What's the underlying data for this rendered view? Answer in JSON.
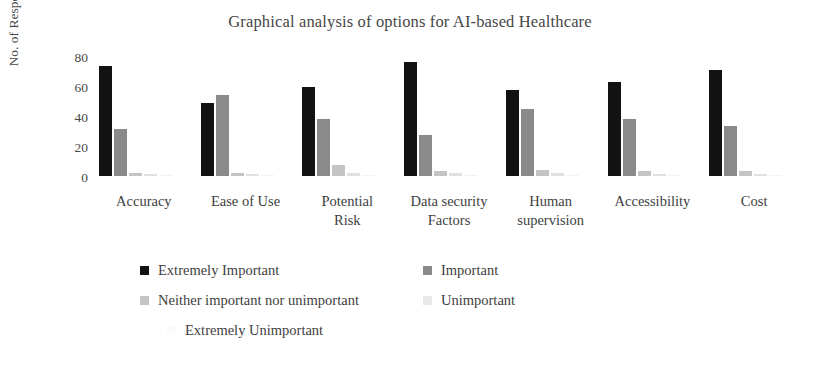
{
  "chart_data": {
    "type": "bar",
    "title": "Graphical analysis of options for AI-based Healthcare",
    "xlabel": "",
    "ylabel": "No. of Respondents",
    "ylim": [
      0,
      80
    ],
    "yticks": [
      0,
      20,
      40,
      60,
      80
    ],
    "grid": false,
    "legend_position": "bottom",
    "grouping": "clustered",
    "categories": [
      "Accuracy",
      "Ease of Use",
      "Potential Risk",
      "Data security Factors",
      "Human supervision",
      "Accessibility",
      "Cost"
    ],
    "series": [
      {
        "name": "Extremely Important",
        "color": "#121212",
        "values": [
          68,
          45,
          55,
          70,
          53,
          58,
          65
        ]
      },
      {
        "name": "Important",
        "color": "#8a8a8a",
        "values": [
          29,
          50,
          35,
          25,
          41,
          35,
          31
        ]
      },
      {
        "name": "Neither important nor unimportant",
        "color": "#c4c4c4",
        "values": [
          2,
          2,
          7,
          3,
          4,
          3,
          3
        ]
      },
      {
        "name": "Unimportant",
        "color": "#e0e0e0",
        "values": [
          1,
          1,
          2,
          2,
          2,
          1,
          1
        ]
      },
      {
        "name": "Extremely Unimportant",
        "color": "#f2f2f2",
        "values": [
          0,
          0,
          0,
          0,
          0,
          0,
          0
        ]
      }
    ]
  },
  "axis": {
    "y_tick_labels": [
      "80",
      "60",
      "40",
      "20",
      "0"
    ],
    "y_title": "No. of Respondents"
  },
  "category_labels": [
    [
      "Accuracy"
    ],
    [
      "Ease of Use"
    ],
    [
      "Potential",
      "Risk"
    ],
    [
      "Data security",
      "Factors"
    ],
    [
      "Human",
      "supervision"
    ],
    [
      "Accessibility"
    ],
    [
      "Cost"
    ]
  ],
  "legend": {
    "rows": [
      [
        {
          "label": "Extremely Important",
          "color": "#121212",
          "left": 0
        },
        {
          "label": "Important",
          "color": "#8a8a8a",
          "left": 283
        }
      ],
      [
        {
          "label": "Neither important nor unimportant",
          "color": "#c4c4c4",
          "left": 0
        },
        {
          "label": "Unimportant",
          "color": "#e8e8e8",
          "left": 283
        }
      ],
      [
        {
          "label": "Extremely Unimportant",
          "color": "#fbfbfb",
          "left": 27
        }
      ]
    ]
  }
}
